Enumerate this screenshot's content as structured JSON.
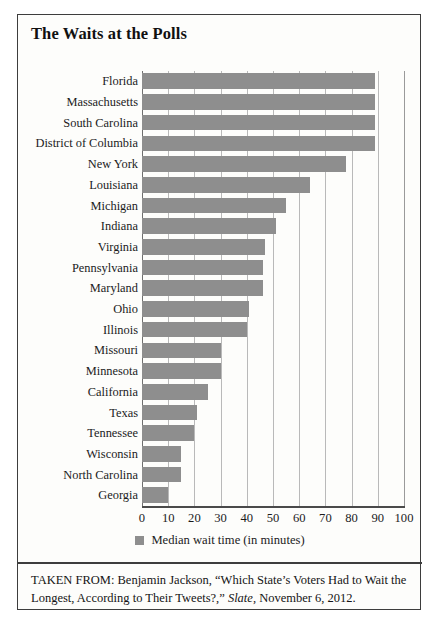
{
  "figure": {
    "title": "The Waits at the Polls",
    "legend_label": "Median wait time (in minutes)",
    "legend_swatch_icon": "gray-square-swatch",
    "caption_prefix": "TAKEN FROM: Benjamin Jackson, “Which State’s Voters Had to Wait the Longest, According to Their Tweets?,” ",
    "caption_source": "Slate",
    "caption_suffix": ", November 6, 2012."
  },
  "colors": {
    "bar_fill": "#8e8e8e",
    "frame_border": "#3d3d3d",
    "gridline": "#b9b9b9",
    "axis_line": "#4a4a4a",
    "background": "#fdfdfb",
    "text": "#1a1a1a"
  },
  "chart_data": {
    "type": "bar",
    "orientation": "horizontal",
    "title": "The Waits at the Polls",
    "xlabel": "",
    "ylabel": "",
    "xlim": [
      0,
      100
    ],
    "xticks": [
      0,
      10,
      20,
      30,
      40,
      50,
      60,
      70,
      80,
      90,
      100
    ],
    "xtick_labels": [
      "0",
      "10",
      "20",
      "30",
      "40",
      "50",
      "60",
      "70",
      "80",
      "90",
      "100"
    ],
    "grid": "vertical",
    "legend": [
      "Median wait time (in minutes)"
    ],
    "legend_position": "below-axis-center",
    "units": "minutes",
    "categories": [
      "Florida",
      "Massachusetts",
      "South Carolina",
      "District of Columbia",
      "New York",
      "Louisiana",
      "Michigan",
      "Indiana",
      "Virginia",
      "Pennsylvania",
      "Maryland",
      "Ohio",
      "Illinois",
      "Missouri",
      "Minnesota",
      "California",
      "Texas",
      "Tennessee",
      "Wisconsin",
      "North Carolina",
      "Georgia"
    ],
    "values": [
      89,
      89,
      89,
      89,
      78,
      64,
      55,
      51,
      47,
      46,
      46,
      41,
      40,
      30,
      30,
      25,
      21,
      20,
      15,
      15,
      10
    ]
  }
}
